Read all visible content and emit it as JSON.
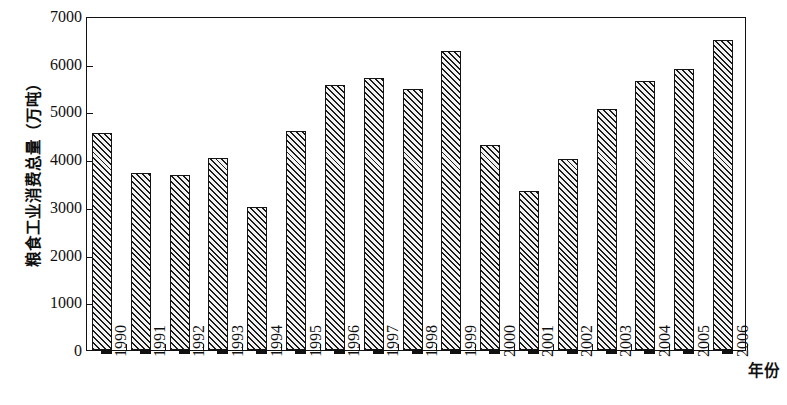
{
  "chart_data": {
    "type": "bar",
    "title": "",
    "xlabel": "年份",
    "ylabel": "粮食工业消费总量（万吨）",
    "ylim": [
      0,
      7000
    ],
    "ytick_labels": [
      "7000",
      "6000",
      "5000",
      "4000",
      "3000",
      "2000",
      "1000",
      "0"
    ],
    "ytick_values": [
      7000,
      6000,
      5000,
      4000,
      3000,
      2000,
      1000,
      0
    ],
    "grid": false,
    "legend": "none",
    "bar_style": "hatched-diagonal-with-black-3d-side",
    "categories": [
      "1990",
      "1991",
      "1992",
      "1993",
      "1994",
      "1995",
      "1996",
      "1997",
      "1998",
      "1999",
      "2000",
      "2001",
      "2002",
      "2003",
      "2004",
      "2005",
      "2006"
    ],
    "values": [
      4540,
      3700,
      3670,
      4020,
      3000,
      4580,
      5550,
      5700,
      5480,
      6270,
      4290,
      3330,
      4000,
      5060,
      5640,
      5890,
      6500
    ],
    "series": [
      {
        "name": "粮食工业消费总量",
        "values": [
          4540,
          3700,
          3670,
          4020,
          3000,
          4580,
          5550,
          5700,
          5480,
          6270,
          4290,
          3330,
          4000,
          5060,
          5640,
          5890,
          6500
        ]
      }
    ]
  }
}
